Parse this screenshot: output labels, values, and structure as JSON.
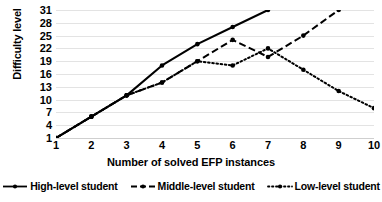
{
  "chart_data": {
    "type": "line",
    "title": "",
    "xlabel": "Number of solved EFP instances",
    "ylabel": "Difficulty level",
    "x": [
      1,
      2,
      3,
      4,
      5,
      6,
      7,
      8,
      9,
      10
    ],
    "xticklabels": [
      "1",
      "2",
      "3",
      "4",
      "5",
      "6",
      "7",
      "8",
      "9",
      "10"
    ],
    "yticklabels": [
      "1",
      "4",
      "7",
      "10",
      "13",
      "16",
      "19",
      "22",
      "25",
      "28",
      "31"
    ],
    "yticks": [
      1,
      4,
      7,
      10,
      13,
      16,
      19,
      22,
      25,
      28,
      31
    ],
    "xlim": [
      1,
      10
    ],
    "ylim": [
      1,
      31
    ],
    "grid": "horizontal",
    "legend_position": "bottom",
    "series": [
      {
        "name": "High-level student",
        "style": "solid",
        "color": "#000000",
        "marker": "circle",
        "x": [
          1,
          2,
          3,
          4,
          5,
          6,
          7
        ],
        "values": [
          1,
          6,
          11,
          18,
          23,
          27,
          31
        ]
      },
      {
        "name": "Middle-level student",
        "style": "dashed",
        "color": "#000000",
        "marker": "circle",
        "x": [
          1,
          2,
          3,
          4,
          5,
          6,
          7,
          8,
          9
        ],
        "values": [
          1,
          6,
          11,
          14,
          19,
          24,
          20,
          25,
          31
        ]
      },
      {
        "name": "Low-level student",
        "style": "dotted",
        "color": "#000000",
        "marker": "circle",
        "x": [
          1,
          2,
          3,
          4,
          5,
          6,
          7,
          8,
          9,
          10
        ],
        "values": [
          1,
          6,
          11,
          14,
          19,
          18,
          22,
          17,
          12,
          8
        ]
      }
    ]
  }
}
